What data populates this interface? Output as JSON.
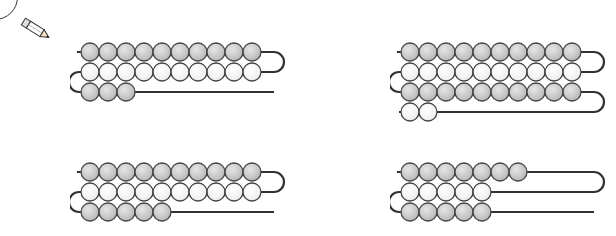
{
  "worksheet": {
    "type": "bead-string counting exercise",
    "icon": "pencil-icon",
    "colors": {
      "dark_bead": "#b9b9b9",
      "light_bead": "#eeeeee",
      "string": "#333333",
      "bead_outline": "#444444"
    },
    "groups": [
      {
        "id": "top-left",
        "rows": [
          10,
          10,
          3
        ],
        "shades": [
          "dark",
          "light",
          "dark"
        ],
        "total": 23
      },
      {
        "id": "top-right",
        "rows": [
          10,
          10,
          10,
          2
        ],
        "shades": [
          "dark",
          "light",
          "dark",
          "light"
        ],
        "total": 32
      },
      {
        "id": "bottom-left",
        "rows": [
          10,
          10,
          5
        ],
        "shades": [
          "dark",
          "light",
          "dark"
        ],
        "total": 25
      },
      {
        "id": "bottom-right",
        "rows": [
          7,
          5,
          5
        ],
        "shades": [
          "dark",
          "light",
          "dark"
        ],
        "total": 17
      }
    ]
  }
}
